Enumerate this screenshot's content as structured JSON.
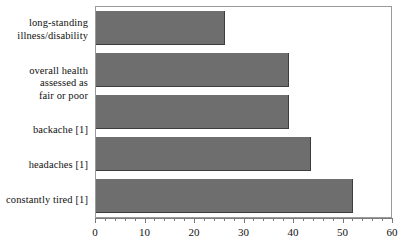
{
  "chart_data": {
    "type": "bar",
    "orientation": "horizontal",
    "title": "",
    "subtitle": "",
    "xlabel": "",
    "ylabel": "",
    "categories": [
      "long-standing illness/disability",
      "overall health assessed as fair or poor",
      "backache [1]",
      "headaches [1]",
      "constantly tired [1]"
    ],
    "category_lines": [
      [
        "long-standing",
        "illness/disability"
      ],
      [
        "overall health",
        "assessed as",
        "fair or poor"
      ],
      [
        "backache [1]"
      ],
      [
        "headaches [1]"
      ],
      [
        "constantly tired [1]"
      ]
    ],
    "values": [
      26,
      39,
      39,
      43.5,
      52
    ],
    "xlim": [
      0,
      60
    ],
    "xticks": [
      0,
      10,
      20,
      30,
      40,
      50,
      60
    ],
    "xtick_labels": [
      "0",
      "10",
      "20",
      "30",
      "40",
      "50",
      "60"
    ],
    "minor_tick_step": 2,
    "grid": false,
    "legend": false,
    "bar_color": "#6e6e6e",
    "bar_edge_color": "#3d3d3d",
    "frame_color": "#9a9a9a",
    "background_color": "#ffffff"
  }
}
